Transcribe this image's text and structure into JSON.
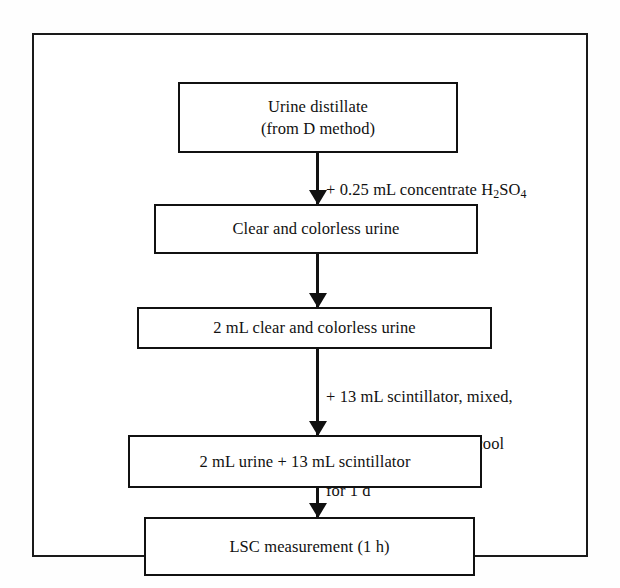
{
  "diagram": {
    "frame_color": "#1a1a1a",
    "line_color": "#111111",
    "background": "#ffffff",
    "nodes": [
      {
        "id": "node-1",
        "label": "Urine distillate\n(from D method)",
        "line_1": "Urine distillate",
        "line_2": "(from D method)"
      },
      {
        "id": "node-2",
        "label": "Clear and colorless urine"
      },
      {
        "id": "node-3",
        "label": "2 mL clear and colorless urine"
      },
      {
        "id": "node-4",
        "label": "2 mL urine + 13 mL scintillator"
      },
      {
        "id": "node-5",
        "label": "LSC  measurement (1 h)"
      }
    ],
    "annotations": [
      {
        "id": "annotation-1",
        "line_1_prefix": "+  0.25 mL concentrate H",
        "line_1_sub": "2",
        "line_1_mid": "SO",
        "line_1_sub2": "4",
        "line_2_prefix": "+  N",
        "line_2_sub": "2",
        "plain_text": "+ 0.25 mL concentrate H2SO4 / + N2"
      },
      {
        "id": "annotation-2",
        "line_1": "+ 13 mL scintillator, mixed,",
        "line_2": "stored in the dark and cool",
        "line_3": "for 1 d",
        "plain_text": "+ 13 mL scintillator, mixed, stored in the dark and cool for 1 d"
      }
    ],
    "connectors": [
      {
        "id": "connector-1",
        "from": "node-1",
        "to": "node-2",
        "direction": "down"
      },
      {
        "id": "connector-2",
        "from": "node-2",
        "to": "node-3",
        "direction": "down"
      },
      {
        "id": "connector-3",
        "from": "node-3",
        "to": "node-4",
        "direction": "down"
      },
      {
        "id": "connector-4",
        "from": "node-4",
        "to": "node-5",
        "direction": "down"
      }
    ]
  }
}
